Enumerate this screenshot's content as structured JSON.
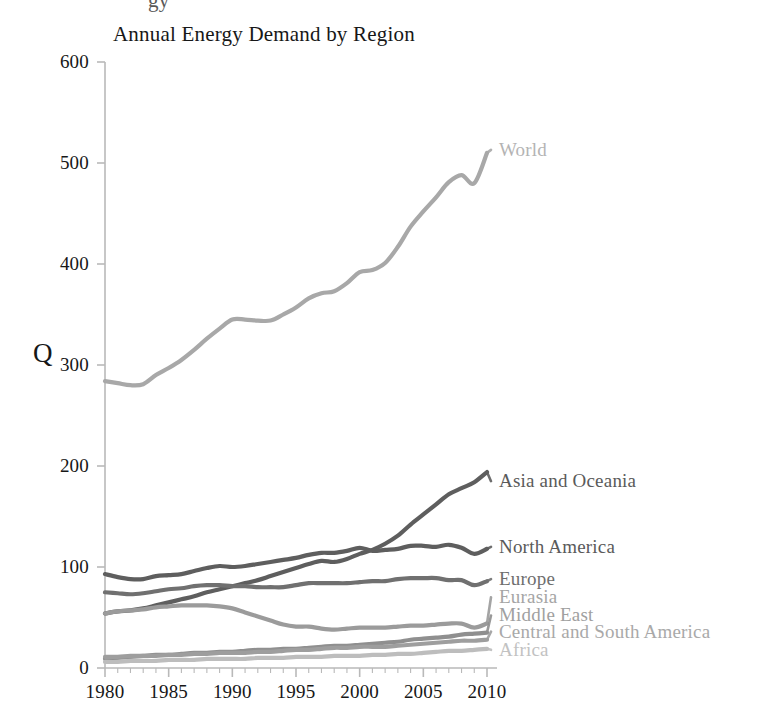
{
  "figure": {
    "clipped_text_above": "gy",
    "title": "Annual Energy Demand by Region",
    "background_color": "#ffffff"
  },
  "axes": {
    "y_label": "Q",
    "y_ticks": [
      "0",
      "100",
      "200",
      "300",
      "400",
      "500",
      "600"
    ],
    "x_ticks": [
      "1980",
      "1985",
      "1990",
      "1995",
      "2000",
      "2005",
      "2010"
    ],
    "axis_color": "#b9b9b9"
  },
  "labels": {
    "world": "World",
    "asia_and_oceania": "Asia and Oceania",
    "north_america": "North America",
    "europe": "Europe",
    "eurasia": "Eurasia",
    "middle_east": "Middle East",
    "central_and_south_america": "Central and South America",
    "africa": "Africa"
  },
  "chart_data": {
    "type": "line",
    "title": "Annual Energy Demand by Region",
    "xlabel": "",
    "ylabel": "Q",
    "xlim": [
      1980,
      2010
    ],
    "ylim": [
      0,
      600
    ],
    "grid": false,
    "legend_position": "right-inline",
    "x": [
      1980,
      1981,
      1982,
      1983,
      1984,
      1985,
      1986,
      1987,
      1988,
      1989,
      1990,
      1991,
      1992,
      1993,
      1994,
      1995,
      1996,
      1997,
      1998,
      1999,
      2000,
      2001,
      2002,
      2003,
      2004,
      2005,
      2006,
      2007,
      2008,
      2009,
      2010
    ],
    "series": [
      {
        "name": "World",
        "color": "#a8a8a8",
        "label_color": "#b4b4b4",
        "label_y": 513,
        "values": [
          284,
          282,
          280,
          281,
          290,
          297,
          305,
          315,
          326,
          336,
          345,
          345,
          344,
          344,
          350,
          357,
          366,
          371,
          373,
          381,
          392,
          394,
          401,
          417,
          437,
          452,
          466,
          481,
          488,
          480,
          510
        ]
      },
      {
        "name": "Asia and Oceania",
        "color": "#5e5e5e",
        "label_color": "#5a5a5a",
        "label_y": 185,
        "values": [
          54,
          56,
          57,
          59,
          62,
          65,
          68,
          71,
          75,
          78,
          81,
          84,
          87,
          91,
          95,
          99,
          103,
          106,
          105,
          108,
          113,
          117,
          123,
          131,
          142,
          152,
          162,
          172,
          178,
          184,
          194
        ]
      },
      {
        "name": "North America",
        "color": "#5e5e5e",
        "label_color": "#5a5a5a",
        "label_y": 120,
        "values": [
          93,
          90,
          88,
          88,
          91,
          92,
          93,
          96,
          99,
          101,
          100,
          101,
          103,
          105,
          107,
          109,
          112,
          114,
          114,
          116,
          119,
          116,
          117,
          118,
          121,
          121,
          120,
          122,
          119,
          113,
          118
        ]
      },
      {
        "name": "Europe",
        "color": "#707070",
        "label_color": "#6e6e6e",
        "label_y": 88,
        "values": [
          75,
          74,
          73,
          74,
          76,
          78,
          79,
          81,
          82,
          82,
          81,
          81,
          80,
          80,
          80,
          82,
          84,
          84,
          84,
          84,
          85,
          86,
          86,
          88,
          89,
          89,
          89,
          87,
          87,
          82,
          86
        ]
      },
      {
        "name": "Eurasia",
        "color": "#9b9b9b",
        "label_color": "#a5a5a5",
        "label_y": 70,
        "values": [
          54,
          56,
          57,
          58,
          60,
          61,
          62,
          62,
          62,
          61,
          59,
          55,
          51,
          47,
          43,
          41,
          41,
          39,
          38,
          39,
          40,
          40,
          40,
          41,
          42,
          42,
          43,
          44,
          44,
          40,
          44
        ]
      },
      {
        "name": "Middle East",
        "color": "#8f8f8f",
        "label_color": "#a0a0a0",
        "label_y": 52,
        "values": [
          9,
          10,
          11,
          12,
          13,
          13,
          14,
          15,
          15,
          16,
          16,
          17,
          18,
          18,
          19,
          19,
          20,
          21,
          22,
          22,
          23,
          24,
          25,
          26,
          28,
          29,
          30,
          31,
          33,
          34,
          35
        ]
      },
      {
        "name": "Central and South America",
        "color": "#9e9e9e",
        "label_color": "#a9a9a9",
        "label_y": 36,
        "values": [
          11,
          11,
          12,
          12,
          12,
          13,
          13,
          14,
          14,
          15,
          15,
          15,
          16,
          16,
          17,
          18,
          18,
          19,
          20,
          20,
          21,
          21,
          21,
          22,
          23,
          24,
          25,
          26,
          27,
          27,
          28
        ]
      },
      {
        "name": "Africa",
        "color": "#bdbdbd",
        "label_color": "#c2c2c2",
        "label_y": 18,
        "values": [
          6,
          6,
          7,
          7,
          7,
          8,
          8,
          8,
          9,
          9,
          9,
          9,
          10,
          10,
          10,
          11,
          11,
          11,
          12,
          12,
          12,
          13,
          13,
          14,
          14,
          15,
          16,
          17,
          17,
          18,
          19
        ]
      }
    ]
  }
}
